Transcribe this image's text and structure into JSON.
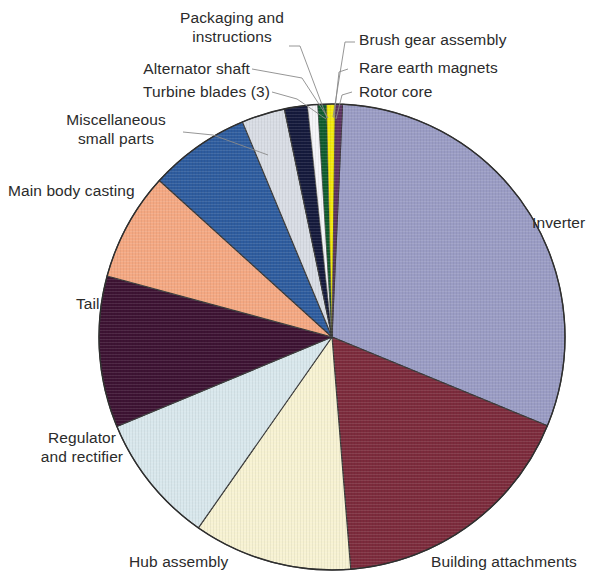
{
  "chart_data": {
    "type": "pie",
    "title": "",
    "subtitle": "",
    "xlabel": "",
    "ylabel": "",
    "legend_position": "callout-labels",
    "grid": false,
    "center_px": [
      332,
      337
    ],
    "radius_px": 233,
    "start_angle_deg": 0,
    "direction": "clockwise",
    "categories": [
      "Inverter",
      "Building attachments",
      "Hub assembly",
      "Regulator and rectifier",
      "Tail",
      "Main body casting",
      "Miscellaneous small parts",
      "Turbine blades (3)",
      "Alternator shaft",
      "Packaging and instructions",
      "Brush gear assembly",
      "Rare earth magnets",
      "Rotor core"
    ],
    "values": [
      30.5,
      17.5,
      11.0,
      9.0,
      10.5,
      7.5,
      7.0,
      3.0,
      1.6,
      0.7,
      0.6,
      0.6,
      0.5
    ],
    "unit": "%",
    "colors": [
      "#9a9cc4",
      "#7c2b3c",
      "#f7f2d2",
      "#d8e7ec",
      "#3d1333",
      "#f4a882",
      "#2e5c9e",
      "#d8dce4",
      "#151a3c",
      "#f4f4f8",
      "#0f5c2e",
      "#f2e80c",
      "#5c3160"
    ],
    "slices": [
      {
        "label": "Inverter",
        "value": 30.5,
        "color": "#9a9cc4",
        "a0": 9.5,
        "a1": 179.0
      },
      {
        "label": "Building attachments",
        "value": 17.5,
        "color": "#7c2b3c",
        "a0": 179.0,
        "a1": 241.0
      },
      {
        "label": "Hub assembly",
        "value": 11.0,
        "color": "#f7f2d2",
        "a0": 241.0,
        "a1": 280.0
      },
      {
        "label": "Regulator and rectifier",
        "value": 9.0,
        "color": "#d8e7ec",
        "a0": 280.0,
        "a1": 312.0
      },
      {
        "label": "Tail",
        "value": 10.5,
        "color": "#3d1333",
        "a0": 312.0,
        "a1": 349.5
      },
      {
        "label": "Main body casting",
        "value": 7.5,
        "color": "#f4a882",
        "a0": 349.5,
        "a1": 376.0
      },
      {
        "label": "Miscellaneous small parts",
        "value": 7.0,
        "color": "#2e5c9e",
        "a0": 376.0,
        "a1": 401.0
      },
      {
        "label": "Turbine blades (3)",
        "value": 3.0,
        "color": "#d8dce4",
        "a0": 401.0,
        "a1": 353.0
      },
      {
        "label": "Alternator shaft",
        "value": 1.6,
        "color": "#151a3c",
        "a0": 0.0,
        "a1": 0.0
      },
      {
        "label": "Packaging and instructions",
        "value": 0.7,
        "color": "#f4f4f8",
        "a0": 0.0,
        "a1": 0.0
      },
      {
        "label": "Brush gear assembly",
        "value": 0.6,
        "color": "#0f5c2e",
        "a0": 0.0,
        "a1": 0.0
      },
      {
        "label": "Rare earth magnets",
        "value": 0.6,
        "color": "#f2e80c",
        "a0": 0.0,
        "a1": 0.0
      },
      {
        "label": "Rotor core",
        "value": 0.5,
        "color": "#5c3160",
        "a0": 0.0,
        "a1": 0.0
      }
    ]
  },
  "labels": {
    "packaging_line1": "Packaging and",
    "packaging_line2": "instructions",
    "alternator": "Alternator shaft",
    "turbine": "Turbine blades (3)",
    "misc_line1": "Miscellaneous",
    "misc_line2": "small parts",
    "main_body": "Main body casting",
    "tail": "Tail",
    "regulator_line1": "Regulator",
    "regulator_line2": "and rectifier",
    "hub": "Hub assembly",
    "building": "Building attachments",
    "inverter": "Inverter",
    "brush": "Brush gear assembly",
    "rare_earth": "Rare earth magnets",
    "rotor": "Rotor core"
  }
}
